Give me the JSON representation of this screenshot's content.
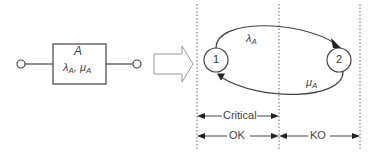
{
  "component": {
    "name": "A",
    "rates": "λA, μA",
    "rates_parts": {
      "lambda": "λ",
      "lambda_sub": "A",
      "sep": ", ",
      "mu": "μ",
      "mu_sub": "A"
    }
  },
  "markov": {
    "states": [
      {
        "id": "1",
        "label": "1"
      },
      {
        "id": "2",
        "label": "2"
      }
    ],
    "transitions": [
      {
        "from": "1",
        "to": "2",
        "symbol": "λ",
        "sub": "A"
      },
      {
        "from": "2",
        "to": "1",
        "symbol": "μ",
        "sub": "A"
      }
    ]
  },
  "regions": {
    "critical": "Critical",
    "ok": "OK",
    "ko": "KO"
  },
  "colors": {
    "line": "#444444",
    "dotted": "#666666",
    "arrow_outline": "#999999"
  }
}
